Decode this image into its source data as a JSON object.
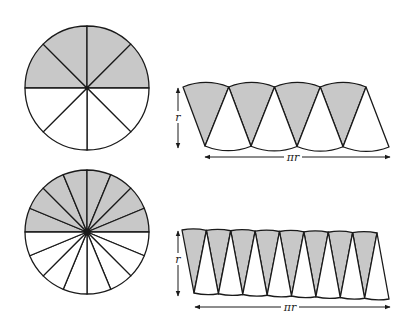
{
  "diagram": {
    "title": "",
    "fill_color": "#c8c8c8",
    "stroke_color": "#1a1a1a",
    "panels": [
      {
        "name": "eight-sectors",
        "sector_count": 8,
        "shaded_sectors": "top half",
        "height_label": "r",
        "width_label": "πr"
      },
      {
        "name": "sixteen-sectors",
        "sector_count": 16,
        "shaded_sectors": "top half",
        "height_label": "r",
        "width_label": "πr"
      }
    ]
  }
}
